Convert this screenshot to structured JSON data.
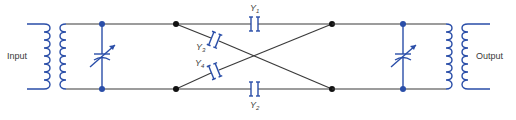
{
  "diagram": {
    "type": "lattice-filter-circuit",
    "labels": {
      "input": "Input",
      "output": "Output"
    },
    "capacitors": [
      {
        "id": "Y1",
        "base": "Y",
        "sub": "1",
        "position": "top-series"
      },
      {
        "id": "Y2",
        "base": "Y",
        "sub": "2",
        "position": "bottom-series"
      },
      {
        "id": "Y3",
        "base": "Y",
        "sub": "3",
        "position": "cross-top-left-to-bottom-right"
      },
      {
        "id": "Y4",
        "base": "Y",
        "sub": "4",
        "position": "cross-bottom-left-to-top-right"
      }
    ],
    "components": {
      "input_transformer": "transformer",
      "output_transformer": "transformer",
      "input_tuning_capacitor": "variable-capacitor",
      "output_tuning_capacitor": "variable-capacitor"
    },
    "colors": {
      "wire": "#3a3a3a",
      "component": "#2a4ea8",
      "junction_black": "#111111",
      "junction_blue": "#2a4ea8"
    }
  }
}
